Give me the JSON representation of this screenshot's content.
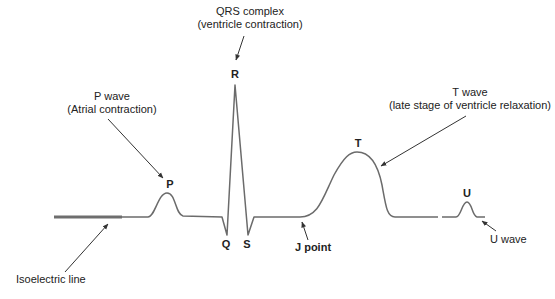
{
  "colors": {
    "trace": "#6b6b6b",
    "isoelectric": "#6e6e6e",
    "arrow": "#333333",
    "text": "#222222",
    "background": "#ffffff"
  },
  "points": {
    "P": "P",
    "Q": "Q",
    "R": "R",
    "S": "S",
    "T": "T",
    "U": "U"
  },
  "annotations": {
    "qrs": {
      "line1": "QRS complex",
      "line2": "(ventricle contraction)"
    },
    "p_wave": {
      "line1": "P wave",
      "line2": "(Atrial contraction)"
    },
    "t_wave": {
      "line1": "T wave",
      "line2": "(late stage of ventricle relaxation)"
    },
    "j_point": "J point",
    "u_wave": "U wave",
    "isoelectric": "Isoelectric line"
  }
}
